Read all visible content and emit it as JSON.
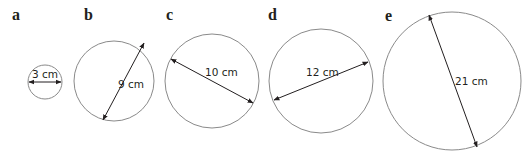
{
  "figure": {
    "colors": {
      "circle_stroke": "#8a8a8a",
      "text": "#231f20",
      "background": "#ffffff"
    },
    "circles": [
      {
        "label": "a",
        "diameter_text": "3 cm",
        "diameter_value": 3,
        "unit": "cm"
      },
      {
        "label": "b",
        "diameter_text": "9 cm",
        "diameter_value": 9,
        "unit": "cm"
      },
      {
        "label": "c",
        "diameter_text": "10 cm",
        "diameter_value": 10,
        "unit": "cm"
      },
      {
        "label": "d",
        "diameter_text": "12 cm",
        "diameter_value": 12,
        "unit": "cm"
      },
      {
        "label": "e",
        "diameter_text": "21 cm",
        "diameter_value": 21,
        "unit": "cm"
      }
    ]
  }
}
